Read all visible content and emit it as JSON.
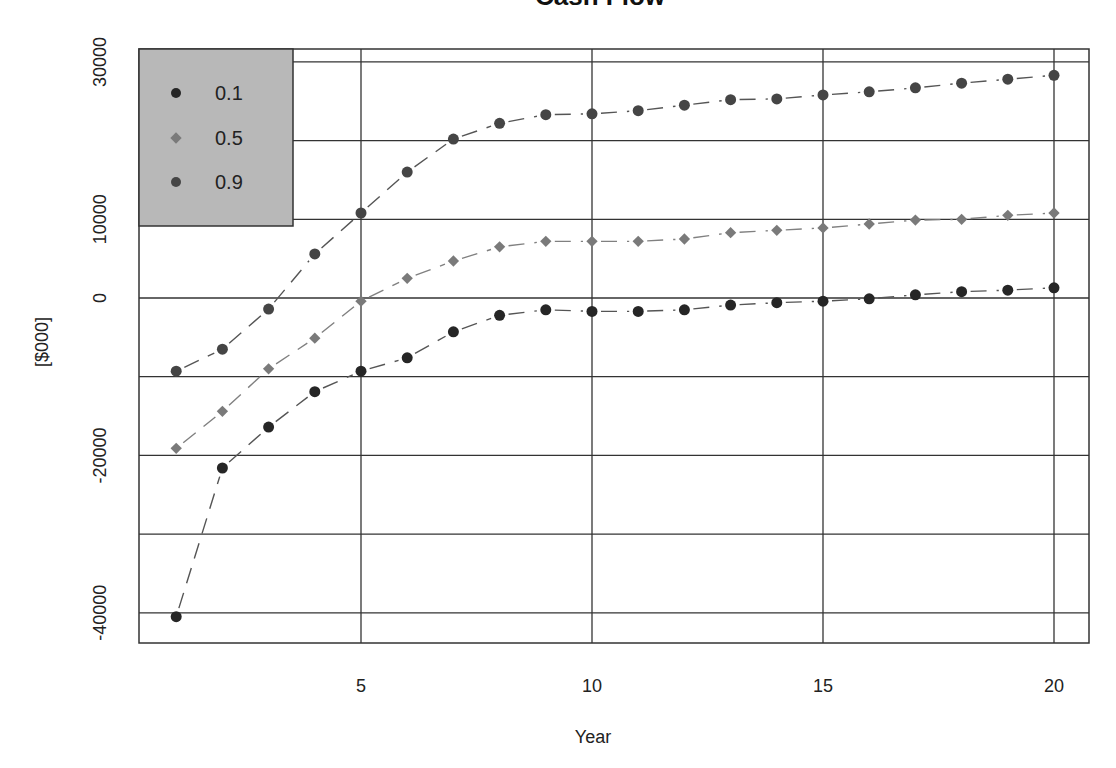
{
  "chart_data": {
    "type": "line",
    "title": "Cash Flow",
    "xlabel": "Year",
    "ylabel": "[$000]",
    "x": [
      1,
      2,
      3,
      4,
      5,
      6,
      7,
      8,
      9,
      10,
      11,
      12,
      13,
      14,
      15,
      16,
      17,
      18,
      19,
      20
    ],
    "x_ticks": [
      5,
      10,
      15,
      20
    ],
    "x_tick_labels": [
      "5",
      "10",
      "15",
      "20"
    ],
    "y_ticks": [
      30000,
      10000,
      0,
      -20000,
      -40000
    ],
    "y_tick_labels": [
      "30000",
      "10000",
      "0",
      "-20000",
      "-40000"
    ],
    "y_gridlines": [
      30000,
      20000,
      10000,
      0,
      -10000,
      -20000,
      -30000,
      -40000
    ],
    "x_gridlines": [
      5,
      10,
      15,
      20
    ],
    "xlim": [
      0.3,
      21.0
    ],
    "ylim": [
      -44500,
      31200
    ],
    "grid": true,
    "legend_position": "top-left",
    "series": [
      {
        "name": "0.1",
        "marker": "circle",
        "color": "#262626",
        "values": [
          -40500,
          -21600,
          -16400,
          -11900,
          -9300,
          -7600,
          -4300,
          -2200,
          -1500,
          -1700,
          -1700,
          -1500,
          -900,
          -600,
          -400,
          -100,
          400,
          800,
          1000,
          1300
        ]
      },
      {
        "name": "0.5",
        "marker": "diamond",
        "color": "#7a7a7a",
        "values": [
          -19100,
          -14400,
          -9000,
          -5100,
          -400,
          2500,
          4700,
          6500,
          7200,
          7200,
          7200,
          7500,
          8300,
          8600,
          8900,
          9400,
          9900,
          10000,
          10500,
          10800
        ]
      },
      {
        "name": "0.9",
        "marker": "circle",
        "color": "#454545",
        "values": [
          -9300,
          -6500,
          -1400,
          5600,
          10800,
          16000,
          20200,
          22200,
          23300,
          23400,
          23800,
          24500,
          25200,
          25300,
          25800,
          26200,
          26700,
          27300,
          27800,
          28300
        ]
      }
    ]
  },
  "legend": {
    "items": [
      {
        "label": "0.1"
      },
      {
        "label": "0.5"
      },
      {
        "label": "0.9"
      }
    ],
    "background": "#b8b8b8"
  }
}
